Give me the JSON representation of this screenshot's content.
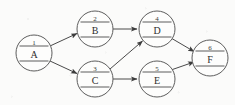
{
  "diagram": {
    "type": "directed-activity-network",
    "background_color": "#fbfbfa",
    "stroke_color": "#5d5d5d",
    "edge_color": "#4a4a4a",
    "nodes": [
      {
        "id": "1",
        "label": "A",
        "cx": 34,
        "cy": 53,
        "r": 18
      },
      {
        "id": "2",
        "label": "B",
        "cx": 95,
        "cy": 29,
        "r": 18
      },
      {
        "id": "3",
        "label": "C",
        "cx": 95,
        "cy": 79,
        "r": 18
      },
      {
        "id": "4",
        "label": "D",
        "cx": 157,
        "cy": 29,
        "r": 18
      },
      {
        "id": "5",
        "label": "E",
        "cx": 157,
        "cy": 79,
        "r": 18
      },
      {
        "id": "6",
        "label": "F",
        "cx": 210,
        "cy": 58,
        "r": 18
      }
    ],
    "edges": [
      {
        "from": "A",
        "to": "B",
        "x1": 50,
        "y1": 46,
        "x2": 79,
        "y2": 33,
        "arrow": true
      },
      {
        "from": "A",
        "to": "C",
        "x1": 50,
        "y1": 61,
        "x2": 79,
        "y2": 74,
        "arrow": true
      },
      {
        "from": "B",
        "to": "D",
        "x1": 113,
        "y1": 29,
        "x2": 139,
        "y2": 29,
        "arrow": true
      },
      {
        "from": "C",
        "to": "D",
        "x1": 110,
        "y1": 69,
        "x2": 144,
        "y2": 40,
        "arrow": true
      },
      {
        "from": "C",
        "to": "E",
        "x1": 113,
        "y1": 79,
        "x2": 139,
        "y2": 79,
        "arrow": true
      },
      {
        "from": "D",
        "to": "F",
        "x1": 172,
        "y1": 38,
        "x2": 196,
        "y2": 52,
        "arrow": true
      },
      {
        "from": "E",
        "to": "F",
        "x1": 172,
        "y1": 70,
        "x2": 196,
        "y2": 61,
        "arrow": true
      }
    ]
  }
}
